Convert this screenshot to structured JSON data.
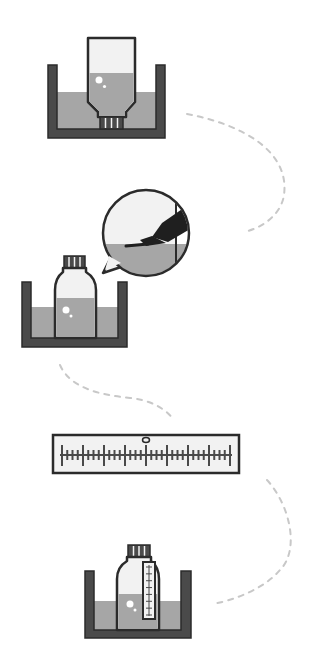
{
  "diagram": {
    "type": "procedure-illustration",
    "step_count": 4,
    "colors": {
      "outline": "#2b2b2b",
      "container": "#4a4a4a",
      "water": "#a6a6a6",
      "bottle_fill": "#f2f2f2",
      "highlight": "#ffffff",
      "dashed_path": "#c8c8c8",
      "background": "#ffffff"
    },
    "steps": [
      {
        "id": 1,
        "name": "inverted-bottle-in-water-bath",
        "icons": [
          "water-bath-icon",
          "inverted-bottle-icon"
        ]
      },
      {
        "id": 2,
        "name": "bottle-in-bath-with-marker-callout",
        "icons": [
          "water-bath-icon",
          "upright-bottle-icon",
          "magnifier-callout-icon",
          "marker-pen-icon"
        ]
      },
      {
        "id": 3,
        "name": "ruler-measurement",
        "icons": [
          "ruler-icon"
        ]
      },
      {
        "id": 4,
        "name": "bottle-with-scale-in-bath",
        "icons": [
          "water-bath-icon",
          "graduated-bottle-icon"
        ]
      }
    ],
    "ruler": {
      "major_tick_count": 9,
      "minor_ticks_between": 3,
      "marker": "center-ring"
    },
    "thermometer_scale": {
      "tick_count": 8
    }
  }
}
